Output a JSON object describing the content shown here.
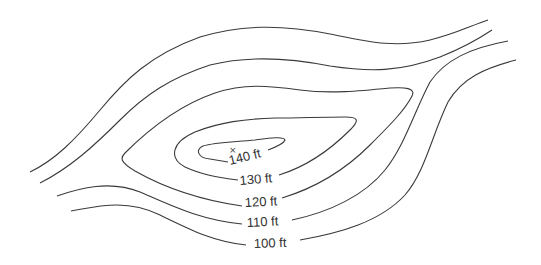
{
  "diagram": {
    "type": "topographic-contour-map",
    "summit_marker": "×",
    "contour_interval": "10 ft",
    "contours": [
      {
        "id": "c100",
        "label": "100 ft"
      },
      {
        "id": "c110",
        "label": "110 ft"
      },
      {
        "id": "c120",
        "label": "120 ft"
      },
      {
        "id": "c130",
        "label": "130 ft"
      },
      {
        "id": "c140",
        "label": "140 ft"
      }
    ],
    "line_color": "#3a3a3a",
    "background": "#ffffff"
  }
}
